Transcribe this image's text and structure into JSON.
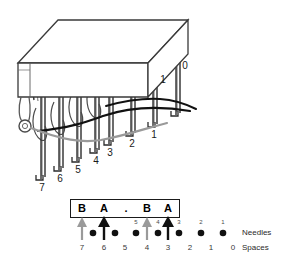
{
  "diagram": {
    "bed": {
      "name": "needle-bar",
      "face_color": "#ffffff",
      "edge_color": "#3a3a3a"
    },
    "needles": [
      {
        "id": "needle-7",
        "label": "7",
        "x": 40,
        "y": 160
      },
      {
        "id": "needle-6",
        "label": "6",
        "x": 67,
        "y": 152
      },
      {
        "id": "needle-5",
        "label": "5",
        "x": 92,
        "y": 144
      },
      {
        "id": "needle-4",
        "label": "4",
        "x": 117,
        "y": 136
      },
      {
        "id": "needle-3",
        "label": "3",
        "x": 141,
        "y": 127
      },
      {
        "id": "needle-2",
        "label": "2",
        "x": 165,
        "y": 119
      },
      {
        "id": "needle-1",
        "label": "1",
        "x": 188,
        "y": 110
      },
      {
        "id": "needle-0",
        "label": "0",
        "x": 211,
        "y": 55
      }
    ],
    "needle_top_labels": [
      {
        "id": "top-label-1",
        "label": "1",
        "x": 186,
        "y": 68
      },
      {
        "id": "top-label-0",
        "label": "0",
        "x": 209,
        "y": 56
      }
    ],
    "yarns": [
      {
        "id": "yarn-black",
        "color": "#111111"
      },
      {
        "id": "yarn-gray",
        "color": "#9a9a9a"
      }
    ],
    "eyelet": {
      "id": "yarn-eyelet",
      "x": 22,
      "y": 126
    }
  },
  "chart": {
    "characters": [
      {
        "slot": 7,
        "char": "B"
      },
      {
        "slot": 6,
        "char": "A"
      },
      {
        "slot": 5,
        "char": "."
      },
      {
        "slot": 4,
        "char": "B"
      },
      {
        "slot": 3,
        "char": "A"
      }
    ],
    "arrows": [
      {
        "slot": 7,
        "color": "#9a9a9a",
        "style": "gray"
      },
      {
        "slot": 6,
        "color": "#111111",
        "style": "black"
      },
      {
        "slot": 4,
        "color": "#9a9a9a",
        "style": "gray"
      },
      {
        "slot": 3,
        "color": "#111111",
        "style": "black"
      }
    ],
    "dots": [
      {
        "slot": 6,
        "needle_label": ""
      },
      {
        "slot": 5,
        "needle_label": ""
      },
      {
        "slot": 4,
        "needle_label": "5"
      },
      {
        "slot": 3,
        "needle_label": "4"
      },
      {
        "slot": 2,
        "needle_label": "3"
      },
      {
        "slot": 1,
        "needle_label": "2"
      },
      {
        "slot": 0,
        "needle_label": "1"
      }
    ],
    "needle_labels_row": [
      "5",
      "4",
      "3",
      "2",
      "1"
    ],
    "spaces_row": [
      "7",
      "6",
      "5",
      "4",
      "3",
      "2",
      "1",
      "0"
    ],
    "row_names": {
      "needles": "Needles",
      "spaces": "Spaces"
    },
    "dot_color": "#111111",
    "box_border_color": "#1a1a1a"
  }
}
